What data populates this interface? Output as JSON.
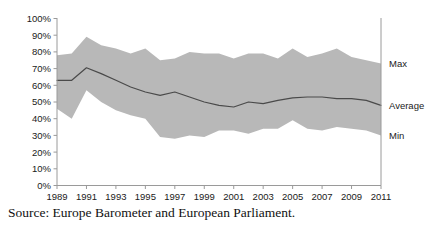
{
  "figure": {
    "source_caption": "Source: Europe Barometer and European Parliament."
  },
  "chart_data": {
    "type": "area",
    "title": "",
    "subtitle": "",
    "xlabel": "",
    "ylabel": "",
    "xlim": [
      1989,
      2011
    ],
    "ylim": [
      0,
      100
    ],
    "grid": false,
    "legend_position": "right-inline",
    "band_color": "#b8b8b8",
    "line_color": "#4a4a4a",
    "axis_color": "#9a9a9a",
    "background_color": "#ffffff",
    "x": [
      1989,
      1990,
      1991,
      1992,
      1993,
      1994,
      1995,
      1996,
      1997,
      1998,
      1999,
      2000,
      2001,
      2002,
      2003,
      2004,
      2005,
      2006,
      2007,
      2008,
      2009,
      2010,
      2011
    ],
    "x_tick_labels": [
      "1989",
      "1991",
      "1993",
      "1995",
      "1997",
      "1999",
      "2001",
      "2003",
      "2005",
      "2007",
      "2009",
      "2011"
    ],
    "x_tick_values": [
      1989,
      1991,
      1993,
      1995,
      1997,
      1999,
      2001,
      2003,
      2005,
      2007,
      2009,
      2011
    ],
    "y_tick_labels": [
      "0%",
      "10%",
      "20%",
      "30%",
      "40%",
      "50%",
      "60%",
      "70%",
      "80%",
      "90%",
      "100%"
    ],
    "y_tick_values": [
      0,
      10,
      20,
      30,
      40,
      50,
      60,
      70,
      80,
      90,
      100
    ],
    "series": [
      {
        "name": "Max",
        "label": "Max",
        "kind": "band-upper",
        "values": [
          78,
          79,
          89,
          84,
          82,
          79,
          82,
          75,
          76,
          80,
          79,
          79,
          76,
          79,
          79,
          76,
          82,
          77,
          79,
          82,
          77,
          75,
          73
        ]
      },
      {
        "name": "Average",
        "label": "Average",
        "kind": "line",
        "values": [
          63,
          63,
          70.5,
          67,
          63,
          59,
          56,
          54,
          56,
          53,
          50,
          48,
          47,
          50,
          49,
          51,
          52.5,
          53,
          53,
          52,
          52,
          51,
          48
        ]
      },
      {
        "name": "Min",
        "label": "Min",
        "kind": "band-lower",
        "values": [
          46,
          40,
          57,
          50,
          45,
          42,
          40,
          29,
          28,
          30,
          29,
          33,
          33,
          31,
          34,
          34,
          39,
          34,
          33,
          35,
          34,
          33,
          30
        ]
      }
    ]
  }
}
